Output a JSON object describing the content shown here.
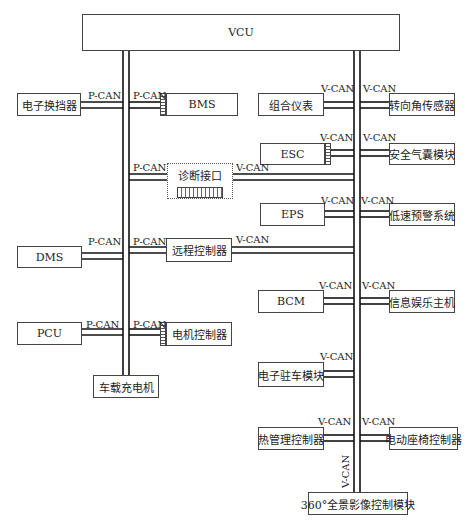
{
  "bus_labels": {
    "p": "P-CAN",
    "v": "V-CAN"
  },
  "nodes": {
    "vcu": "VCU",
    "shifter": "电子换挡器",
    "bms": "BMS",
    "cluster": "组合仪表",
    "steer": "转向角传感器",
    "esc": "ESC",
    "airbag": "安全气囊模块",
    "diag": "诊断接口",
    "eps": "EPS",
    "lowspeed": "低速预警系统",
    "dms": "DMS",
    "remote": "远程控制器",
    "bcm": "BCM",
    "infotain": "信息娱乐主机",
    "pcu": "PCU",
    "motor": "电机控制器",
    "charger": "车载充电机",
    "epb": "电子驻车模块",
    "thermal": "热管理控制器",
    "seat": "电动座椅控制器",
    "surround": "360°全景影像控制模块"
  },
  "colors": {
    "wire": "#111111",
    "box_border": "#444444",
    "background": "#ffffff"
  }
}
